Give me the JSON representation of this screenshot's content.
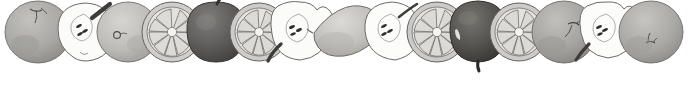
{
  "image": {
    "kind": "decorative-border-illustration",
    "subject": "grayscale botanical fruit border",
    "width": 688,
    "height": 94,
    "background_color": "#ffffff",
    "ink_color": "#3a3a3a",
    "style": "engraved / watercolour grayscale still-life",
    "fruit_count": 15,
    "arrangement": "single overlapping horizontal row aligned to top edge",
    "empty_area": "lower third of canvas is blank white"
  },
  "palette": {
    "white": "#ffffff",
    "flesh_light": "#fbfbfa",
    "flesh_shadow": "#e6e5e2",
    "skin_light": "#cfcecb",
    "skin_mid": "#a9a8a5",
    "skin_dark": "#8d8c89",
    "skin_very_dark": "#5f5e5c",
    "outline": "#5a5956",
    "outline_soft": "#807f7c",
    "seed": "#2f2e2c",
    "stem": "#3d3c3a"
  },
  "fruits": [
    {
      "index": 1,
      "name": "whole-apple-gray",
      "type": "apple",
      "cut": "whole",
      "tone": "mid-gray",
      "cx": 38,
      "cy": 32,
      "rx": 33,
      "ry": 31,
      "fill": "#a9a8a5",
      "stem": "top-center",
      "stem_angle": -15,
      "notes": "round apple, calyx dimple at top, soft shading on lower left"
    },
    {
      "index": 2,
      "name": "halved-apple-seeds",
      "type": "apple",
      "cut": "half",
      "tone": "white-flesh",
      "cx": 85,
      "cy": 32,
      "rx": 29,
      "ry": 30,
      "fill": "#fbfbfa",
      "stem": "upper-right",
      "stem_angle": -42,
      "seeds": 3,
      "notes": "cut face showing core outline and dark seeds, thick dark stem to upper right"
    },
    {
      "index": 3,
      "name": "whole-apple-light",
      "type": "apple",
      "cut": "whole",
      "tone": "light-gray",
      "cx": 128,
      "cy": 32,
      "rx": 31,
      "ry": 30,
      "fill": "#bdbcb9",
      "stem": "center-dimple",
      "stem_angle": 0,
      "notes": "round pale apple, small calyx ring left of centre"
    },
    {
      "index": 4,
      "name": "citrus-cross-section",
      "type": "citrus",
      "cut": "cross-section",
      "tone": "light-gray",
      "cx": 172,
      "cy": 32,
      "rx": 30,
      "ry": 30,
      "fill": "#cfcecb",
      "segments": 9,
      "notes": "radial wedge segments with pale pith centre and rind ring"
    },
    {
      "index": 5,
      "name": "whole-apple-dark",
      "type": "apple",
      "cut": "whole",
      "tone": "dark-gray",
      "cx": 216,
      "cy": 31,
      "rx": 29,
      "ry": 30,
      "fill": "#5f5e5c",
      "stem": "top-center",
      "stem_angle": -8,
      "highlight": true,
      "notes": "darkest apple of the row, long stem and bright crescent highlight on right cheek"
    },
    {
      "index": 6,
      "name": "citrus-cross-section",
      "type": "citrus",
      "cut": "cross-section",
      "tone": "light-gray",
      "cx": 259,
      "cy": 32,
      "rx": 29,
      "ry": 29,
      "fill": "#cdccc9",
      "segments": 9,
      "notes": "second orange slice, segments radiating from white core"
    },
    {
      "index": 7,
      "name": "halved-apple-seeds",
      "type": "apple",
      "cut": "half",
      "tone": "white-flesh",
      "cx": 300,
      "cy": 31,
      "rx": 28,
      "ry": 29,
      "fill": "#fbfbfa",
      "stem": "lower-left",
      "stem_angle": 215,
      "seeds": 3,
      "notes": "lobed cut face with seed cluster, dark stem sweeping to lower left"
    },
    {
      "index": 8,
      "name": "whole-lemon",
      "type": "lemon",
      "cut": "whole",
      "tone": "light-gray",
      "cx": 348,
      "cy": 33,
      "rx": 34,
      "ry": 27,
      "fill": "#c2c1be",
      "notes": "pointed oval lemon lying on its side, nipples at both ends"
    },
    {
      "index": 9,
      "name": "halved-apple-seeds",
      "type": "apple",
      "cut": "half",
      "tone": "white-flesh",
      "cx": 392,
      "cy": 31,
      "rx": 28,
      "ry": 29,
      "fill": "#fcfcfb",
      "stem": "upper-right",
      "stem_angle": -38,
      "seeds": 3,
      "notes": "cut apple half, thin curved stem rising to the right"
    },
    {
      "index": 10,
      "name": "citrus-cross-section",
      "type": "citrus",
      "cut": "cross-section",
      "tone": "light-gray",
      "cx": 437,
      "cy": 32,
      "rx": 30,
      "ry": 30,
      "fill": "#cbcac7",
      "segments": 9,
      "notes": "third orange slice with well defined wedge outlines"
    },
    {
      "index": 11,
      "name": "whole-apple-dark",
      "type": "apple",
      "cut": "whole",
      "tone": "very-dark",
      "cx": 478,
      "cy": 31,
      "rx": 28,
      "ry": 30,
      "fill": "#55534f",
      "stem": "bottom-center",
      "stem_angle": 180,
      "highlight": true,
      "notes": "very dark apple with stub stem pointing down and small light fleck on left"
    },
    {
      "index": 12,
      "name": "citrus-cross-section",
      "type": "citrus",
      "cut": "cross-section",
      "tone": "light-gray",
      "cx": 519,
      "cy": 32,
      "rx": 29,
      "ry": 29,
      "fill": "#cccbc8",
      "segments": 9,
      "notes": "fourth orange slice, overlapped on both sides"
    },
    {
      "index": 13,
      "name": "whole-apple-gray",
      "type": "apple",
      "cut": "whole",
      "tone": "mid-gray",
      "cx": 564,
      "cy": 32,
      "rx": 32,
      "ry": 31,
      "fill": "#a5a4a1",
      "stem": "top-right",
      "stem_angle": 20,
      "notes": "round apple with small stem and calyx to the upper right of centre"
    },
    {
      "index": 14,
      "name": "halved-apple-seeds",
      "type": "apple",
      "cut": "half",
      "tone": "white-flesh",
      "cx": 607,
      "cy": 31,
      "rx": 27,
      "ry": 29,
      "fill": "#fcfcfb",
      "stem": "lower-left",
      "stem_angle": 218,
      "seeds": 3,
      "notes": "final cut half, notched top, stem angled down-left"
    },
    {
      "index": 15,
      "name": "whole-apple-gray",
      "type": "apple",
      "cut": "whole",
      "tone": "mid-gray",
      "cx": 651,
      "cy": 32,
      "rx": 32,
      "ry": 31,
      "fill": "#aaa9a6",
      "stem": "bottom-center-calyx",
      "stem_angle": 175,
      "notes": "last apple of the row, dark calyx mark low-centre"
    }
  ]
}
